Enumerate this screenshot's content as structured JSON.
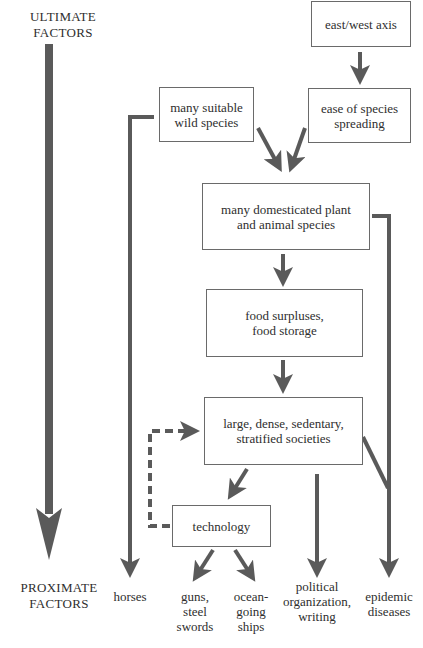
{
  "axis": {
    "top_label": "ULTIMATE\nFACTORS",
    "bottom_label": "PROXIMATE\nFACTORS"
  },
  "colors": {
    "arrow": "#5a5a5a",
    "box_border": "#6a6a6a",
    "text": "#2e2e2e",
    "background": "#ffffff"
  },
  "boxes": {
    "east_west_axis": "east/west axis",
    "ease_of_species_spreading": "ease of species\nspreading",
    "many_suitable_wild_species": "many suitable\nwild species",
    "many_domesticated_species": "many domesticated plant\nand animal species",
    "food_surpluses": "food surpluses,\nfood storage",
    "large_dense_societies": "large, dense, sedentary,\nstratified societies",
    "technology": "technology"
  },
  "outcomes": {
    "horses": "horses",
    "guns_steel_swords": "guns,\nsteel\nswords",
    "ocean_going_ships": "ocean-\ngoing\nships",
    "political_organization": "political\norganization,\nwriting",
    "epidemic_diseases": "epidemic\ndiseases"
  }
}
